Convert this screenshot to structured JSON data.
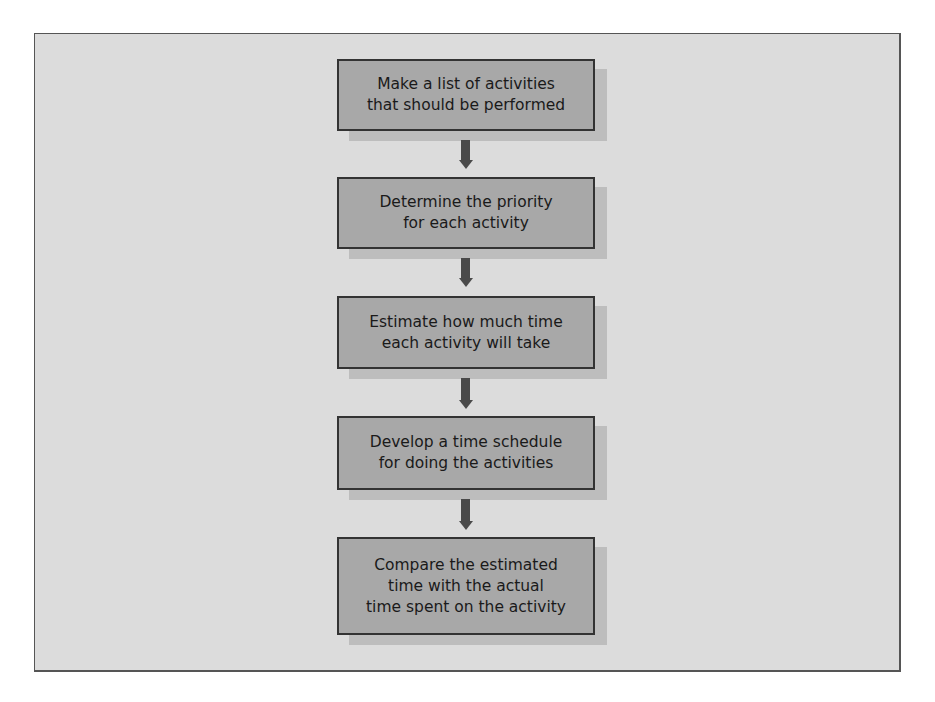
{
  "diagram": {
    "type": "flowchart",
    "direction": "top-to-bottom",
    "steps": [
      {
        "label": "Make a list of activities\nthat should be performed"
      },
      {
        "label": "Determine the priority\nfor each activity"
      },
      {
        "label": "Estimate how much time\neach activity will take"
      },
      {
        "label": "Develop a time schedule\nfor doing the activities"
      },
      {
        "label": "Compare the estimated\ntime with the actual\ntime spent on the activity"
      }
    ],
    "connectors": [
      {
        "from": 0,
        "to": 1,
        "icon": "down-arrow-icon"
      },
      {
        "from": 1,
        "to": 2,
        "icon": "down-arrow-icon"
      },
      {
        "from": 2,
        "to": 3,
        "icon": "down-arrow-icon"
      },
      {
        "from": 3,
        "to": 4,
        "icon": "down-arrow-icon"
      }
    ],
    "colors": {
      "frame_bg": "#dcdcdc",
      "box_fill": "#a8a8a8",
      "box_border": "#333333",
      "box_shadow": "#bdbdbd",
      "arrow": "#4a4a4a"
    }
  }
}
